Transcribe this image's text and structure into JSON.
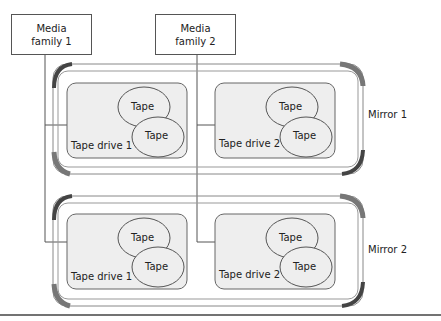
{
  "media_families": [
    {
      "line1": "Media",
      "line2": "family 1"
    },
    {
      "line1": "Media",
      "line2": "family 2"
    }
  ],
  "mirrors": [
    {
      "label": "Mirror 1",
      "drives": [
        {
          "label": "Tape drive 1",
          "tapes": [
            "Tape",
            "Tape"
          ]
        },
        {
          "label": "Tape drive 2",
          "tapes": [
            "Tape",
            "Tape"
          ]
        }
      ]
    },
    {
      "label": "Mirror 2",
      "drives": [
        {
          "label": "Tape drive 1",
          "tapes": [
            "Tape",
            "Tape"
          ]
        },
        {
          "label": "Tape drive 2",
          "tapes": [
            "Tape",
            "Tape"
          ]
        }
      ]
    }
  ]
}
